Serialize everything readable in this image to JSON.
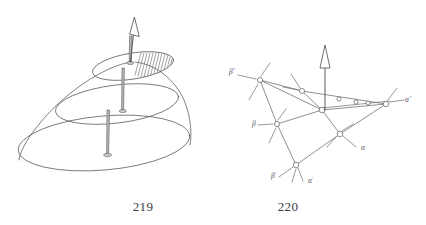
{
  "plate": {
    "background_color": "#ffffff",
    "ink_color": "#4a4a4a",
    "width": 426,
    "height": 225
  },
  "figures": [
    {
      "id": "figure-219",
      "caption": "219",
      "caption_x": 143,
      "caption_y": 211,
      "kind": "dome-with-sections",
      "description": "paraboloid dome with three horizontal elliptical sections each pierced by a vertical pin, hatched sector on upper section, arrow at apex",
      "arrow": {
        "label": "apex-arrow",
        "tip_x": 133,
        "tip_y": 18,
        "base_x": 130,
        "base_y": 62
      },
      "sections": [
        {
          "name": "upper-section",
          "cx": 133,
          "cy": 66,
          "rx": 41,
          "ry": 13,
          "rotation": -9,
          "hatched": true,
          "pin": {
            "x": 133,
            "y": 62,
            "length": 0,
            "has_base": true
          }
        },
        {
          "name": "middle-section",
          "cx": 117,
          "cy": 104,
          "rx": 62,
          "ry": 19,
          "rotation": -7,
          "hatched": false,
          "pin": {
            "x": 123,
            "y": 67,
            "length": 38,
            "has_base": true
          }
        },
        {
          "name": "lower-section",
          "cx": 104,
          "cy": 143,
          "rx": 86,
          "ry": 27,
          "rotation": -5,
          "hatched": false,
          "pin": {
            "x": 108,
            "y": 110,
            "length": 45,
            "has_base": true
          }
        }
      ]
    },
    {
      "id": "figure-220",
      "caption": "220",
      "caption_x": 288,
      "caption_y": 211,
      "kind": "crystal-lattice",
      "description": "crystallographic lattice net of circular nodes joined by bonds with labelled axes and a vertical open arrow",
      "arrow": {
        "label": "vertical-arrow",
        "tip_x": 325,
        "tip_y": 46,
        "base_x": 325,
        "base_y": 110
      },
      "axis_labels": [
        {
          "name": "beta-double-prime",
          "base": "β",
          "prime": "″",
          "x": 229,
          "y": 74
        },
        {
          "name": "beta",
          "base": "β",
          "prime": "",
          "x": 252,
          "y": 126
        },
        {
          "name": "beta-prime",
          "base": "β",
          "prime": "′",
          "x": 271,
          "y": 178
        },
        {
          "name": "alpha-prime",
          "base": "α",
          "prime": "′",
          "x": 308,
          "y": 183
        },
        {
          "name": "alpha",
          "base": "α",
          "prime": "",
          "x": 361,
          "y": 150
        },
        {
          "name": "alpha-double-prime",
          "base": "α",
          "prime": "″",
          "x": 405,
          "y": 102
        }
      ],
      "nodes": [
        {
          "name": "node-beta2-corner",
          "x": 260,
          "y": 80
        },
        {
          "name": "node-top-mid",
          "x": 302,
          "y": 91
        },
        {
          "name": "node-center",
          "x": 322,
          "y": 110
        },
        {
          "name": "node-chain-a",
          "x": 339,
          "y": 99
        },
        {
          "name": "node-chain-b",
          "x": 359,
          "y": 101
        },
        {
          "name": "node-chain-c",
          "x": 371,
          "y": 103
        },
        {
          "name": "node-chain-d",
          "x": 384,
          "y": 102
        },
        {
          "name": "node-right-corner",
          "x": 386,
          "y": 104
        },
        {
          "name": "node-beta-left",
          "x": 277,
          "y": 124
        },
        {
          "name": "node-alpha-right",
          "x": 340,
          "y": 134
        },
        {
          "name": "node-bottom",
          "x": 296,
          "y": 165
        }
      ]
    }
  ]
}
